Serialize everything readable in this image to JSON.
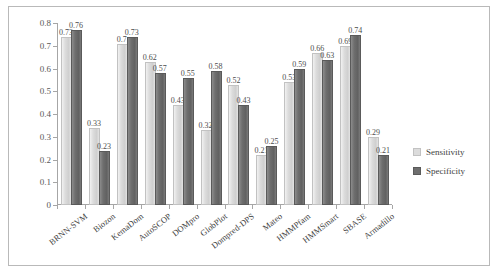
{
  "chart_data": {
    "type": "bar",
    "title": "",
    "subtitle": "",
    "xlabel": "",
    "ylabel": "",
    "ylim": [
      0,
      0.8
    ],
    "yticks": [
      "0",
      "0.1",
      "0.2",
      "0.3",
      "0.4",
      "0.5",
      "0.6",
      "0.7",
      "0.8"
    ],
    "ytick_values": [
      0,
      0.1,
      0.2,
      0.3,
      0.4,
      0.5,
      0.6,
      0.7,
      0.8
    ],
    "grid": false,
    "legend_position": "right",
    "categories": [
      "BRNN-SVM",
      "Biozon",
      "KemaDom",
      "AutoSCOP",
      "DOMpro",
      "GlobPlot",
      "Dompred-DPS",
      "Mateo",
      "HMMPfam",
      "HMMSmart",
      "SBASE",
      "Armadillo"
    ],
    "series": [
      {
        "name": "Sensitivity",
        "color": "#dcdcdc",
        "values": [
          0.73,
          0.33,
          0.7,
          0.62,
          0.43,
          0.32,
          0.52,
          0.21,
          0.53,
          0.66,
          0.69,
          0.29
        ],
        "labels": [
          "0.73",
          "0.33",
          "0.7",
          "0.62",
          "0.43",
          "0.32",
          "0.52",
          "0.21",
          "0.53",
          "0.66",
          "0.69",
          "0.29"
        ]
      },
      {
        "name": "Specificity",
        "color": "#6e6e6e",
        "values": [
          0.76,
          0.23,
          0.73,
          0.57,
          0.55,
          0.58,
          0.43,
          0.25,
          0.59,
          0.63,
          0.74,
          0.21
        ],
        "labels": [
          "0.76",
          "0.23",
          "0.73",
          "0.57",
          "0.55",
          "0.58",
          "0.43",
          "0.25",
          "0.59",
          "0.63",
          "0.74",
          "0.21"
        ]
      }
    ]
  },
  "legend": {
    "items": [
      {
        "label": "Sensitivity"
      },
      {
        "label": "Specificity"
      }
    ]
  }
}
